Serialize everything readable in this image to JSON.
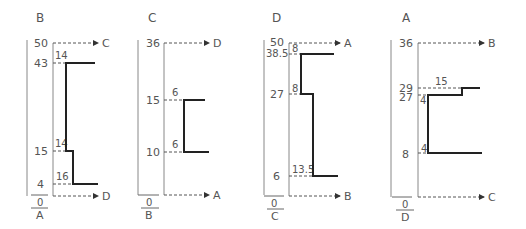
{
  "panels": [
    {
      "title": "B",
      "bottom_numerator": "0",
      "bottom_denominator": "A",
      "top_target": "C",
      "bottom_target": "D",
      "y_labels": [
        "50",
        "43",
        "15",
        "4"
      ],
      "step_labels": [
        "14",
        "14",
        "16"
      ]
    },
    {
      "title": "C",
      "bottom_numerator": "0",
      "bottom_denominator": "B",
      "top_target": "D",
      "bottom_target": "A",
      "y_labels": [
        "36",
        "15",
        "10"
      ],
      "step_labels": [
        "6",
        "6"
      ]
    },
    {
      "title": "D",
      "bottom_numerator": "0",
      "bottom_denominator": "C",
      "top_target": "A",
      "bottom_target": "B",
      "y_labels": [
        "50",
        "38.5",
        "27",
        "6"
      ],
      "step_labels": [
        "8",
        "8",
        "13.5"
      ]
    },
    {
      "title": "A",
      "bottom_numerator": "0",
      "bottom_denominator": "D",
      "top_target": "B",
      "bottom_target": "C",
      "y_labels": [
        "36",
        "29",
        "27",
        "8"
      ],
      "step_labels": [
        "15",
        "4",
        "4"
      ]
    }
  ]
}
